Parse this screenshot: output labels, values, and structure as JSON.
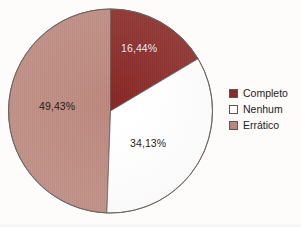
{
  "chart_data": {
    "type": "pie",
    "title": "",
    "subtitle": "",
    "xlabel": "",
    "ylabel": "",
    "grid": false,
    "legend_position": "right",
    "start_angle_deg": 0,
    "direction": "clockwise",
    "categories": [
      "Completo",
      "Nenhum",
      "Errático"
    ],
    "values": [
      16.44,
      34.13,
      49.43
    ],
    "value_unit": "%",
    "data_labels": [
      "16,44%",
      "34,13%",
      "49,43%"
    ],
    "colors": [
      "#8b2a28",
      "#ffffff",
      "#be8a7f"
    ],
    "slice_outline_color": "#5c5553",
    "slices": [
      {
        "name": "Completo",
        "value": 16.44,
        "label": "16,44%",
        "color": "#8b2a28",
        "label_color": "#f4eeec"
      },
      {
        "name": "Nenhum",
        "value": 34.13,
        "label": "34,13%",
        "color": "#ffffff",
        "label_color": "#2b2523"
      },
      {
        "name": "Errático",
        "value": 49.43,
        "label": "49,43%",
        "color": "#be8a7f",
        "label_color": "#241d1b"
      }
    ]
  },
  "legend": {
    "items": [
      {
        "label": "Completo",
        "color": "#8b2a28"
      },
      {
        "label": "Nenhum",
        "color": "#ffffff"
      },
      {
        "label": "Errático",
        "color": "#be8a7f"
      }
    ]
  },
  "labels": {
    "completo": "16,44%",
    "nenhum": "34,13%",
    "erratico": "49,43%"
  }
}
